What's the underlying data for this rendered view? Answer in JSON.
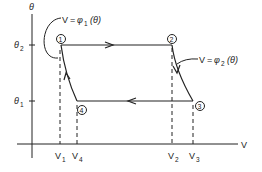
{
  "diagram": {
    "type": "thermodynamic-cycle",
    "axes": {
      "x_label": "V",
      "y_label": "θ",
      "y_ticks": [
        {
          "label": "θ",
          "subscript": "2",
          "position": "top"
        },
        {
          "label": "θ",
          "subscript": "1",
          "position": "bottom"
        }
      ],
      "x_ticks": [
        {
          "label": "V",
          "subscript": "1"
        },
        {
          "label": "V",
          "subscript": "4"
        },
        {
          "label": "V",
          "subscript": "2"
        },
        {
          "label": "V",
          "subscript": "3"
        }
      ]
    },
    "points": [
      {
        "id": "1",
        "label": "1",
        "theta": "θ2",
        "volume": "V1"
      },
      {
        "id": "2",
        "label": "2",
        "theta": "θ2",
        "volume": "V2"
      },
      {
        "id": "3",
        "label": "3",
        "theta": "θ1",
        "volume": "V3"
      },
      {
        "id": "4",
        "label": "4",
        "theta": "θ1",
        "volume": "V4"
      }
    ],
    "curves": [
      {
        "from": "1",
        "to": "2",
        "kind": "isothermal",
        "direction": "right"
      },
      {
        "from": "2",
        "to": "3",
        "kind": "curve",
        "label": "V = φ₂(θ)"
      },
      {
        "from": "3",
        "to": "4",
        "kind": "isothermal",
        "direction": "left"
      },
      {
        "from": "4",
        "to": "1",
        "kind": "curve",
        "label": "V = φ₁(θ)"
      }
    ],
    "annotations": {
      "phi1": {
        "lhs": "V",
        "eq": "=",
        "fn": "φ",
        "sub": "1",
        "arg": "(θ)"
      },
      "phi2": {
        "lhs": "V",
        "eq": "=",
        "fn": "φ",
        "sub": "2",
        "arg": "(θ)"
      }
    },
    "colors": {
      "ink": "#222222",
      "background": "#ffffff"
    }
  }
}
